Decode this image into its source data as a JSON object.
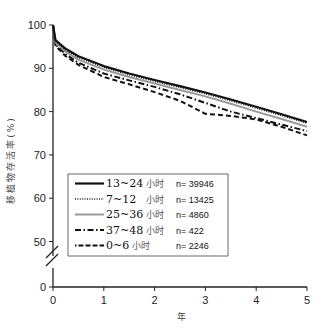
{
  "chart_data": {
    "type": "line",
    "title": "",
    "xlabel": "年",
    "ylabel": "移植物存活率(%)",
    "xlim": [
      0,
      5
    ],
    "ylim_display": [
      50,
      100
    ],
    "y_axis_break": true,
    "x_ticks": [
      "0",
      "1",
      "2",
      "3",
      "4",
      "5"
    ],
    "y_ticks": [
      "0",
      "50",
      "60",
      "70",
      "80",
      "90",
      "100"
    ],
    "grid": false,
    "legend_position": "lower-left-inside",
    "x": [
      0,
      0.05,
      0.25,
      0.5,
      1,
      1.5,
      2,
      2.5,
      3,
      3.5,
      4,
      4.5,
      5
    ],
    "series": [
      {
        "name": "13~24 小时",
        "n": "n= 39946",
        "style": "solid",
        "color": "#111111",
        "values": [
          100,
          96.5,
          94.5,
          92.8,
          90.5,
          88.8,
          87.3,
          85.9,
          84.4,
          82.8,
          81.1,
          79.4,
          77.6
        ]
      },
      {
        "name": "7~12 小时",
        "n": "n= 13425",
        "style": "dotted",
        "color": "#222222",
        "values": [
          100,
          96.3,
          94.2,
          92.5,
          90.2,
          88.5,
          87.0,
          85.6,
          84.1,
          82.5,
          80.8,
          79.1,
          77.3
        ]
      },
      {
        "name": "25~36 小时",
        "n": "n= 4860",
        "style": "solid-gray",
        "color": "#999999",
        "values": [
          100,
          96.0,
          93.8,
          92.0,
          89.7,
          88.0,
          86.5,
          85.0,
          83.5,
          81.8,
          80.0,
          78.3,
          76.5
        ]
      },
      {
        "name": "37~48 小时",
        "n": "n= 422",
        "style": "dash-dot",
        "color": "#111111",
        "values": [
          100,
          95.5,
          93.2,
          91.3,
          88.8,
          87.2,
          85.7,
          84.0,
          82.0,
          80.0,
          78.5,
          77.0,
          75.5
        ]
      },
      {
        "name": "0~6 小时",
        "n": "n= 2246",
        "style": "dashed",
        "color": "#111111",
        "values": [
          100,
          95.2,
          92.8,
          90.8,
          88.0,
          86.3,
          84.5,
          82.5,
          79.5,
          79.0,
          78.2,
          76.5,
          74.5
        ]
      }
    ]
  },
  "legend": {
    "items": [
      {
        "range": "13~24",
        "unit": "小时",
        "n": "n= 39946"
      },
      {
        "range": "7~12",
        "unit": "小时",
        "n": "n= 13425"
      },
      {
        "range": "25~36",
        "unit": "小时",
        "n": "n= 4860"
      },
      {
        "range": "37~48",
        "unit": "小时",
        "n": "n= 422"
      },
      {
        "range": "0~6",
        "unit": "小时",
        "n": "n= 2246"
      }
    ]
  }
}
